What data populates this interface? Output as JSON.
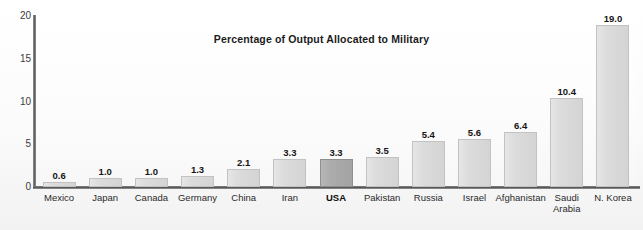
{
  "chart_data": {
    "type": "bar",
    "title": "Percentage of Output Allocated to Military",
    "xlabel": "",
    "ylabel": "",
    "ylim": [
      0,
      20
    ],
    "yticks": [
      "0",
      "5",
      "10",
      "15",
      "20"
    ],
    "grid": false,
    "legend": false,
    "watermark": "Economic Growth",
    "highlight_category": "USA",
    "highlight_color": "#a9a9a9",
    "bar_color": "#dcdcdc",
    "categories": [
      "Mexico",
      "Japan",
      "Canada",
      "Germany",
      "China",
      "Iran",
      "USA",
      "Pakistan",
      "Russia",
      "Israel",
      "Afghanistan",
      "Saudi Arabia",
      "N. Korea"
    ],
    "values": [
      0.6,
      1.0,
      1.0,
      1.3,
      2.1,
      3.3,
      3.3,
      3.5,
      5.4,
      5.6,
      6.4,
      10.4,
      19.0
    ],
    "value_labels": [
      "0.6",
      "1.0",
      "1.0",
      "1.3",
      "2.1",
      "3.3",
      "3.3",
      "3.5",
      "5.4",
      "5.6",
      "6.4",
      "10.4",
      "19.0"
    ],
    "category_labels": [
      "Mexico",
      "Japan",
      "Canada",
      "Germany",
      "China",
      "Iran",
      "USA",
      "Pakistan",
      "Russia",
      "Israel",
      "Afghanistan",
      "Saudi\nArabia",
      "N. Korea"
    ]
  }
}
